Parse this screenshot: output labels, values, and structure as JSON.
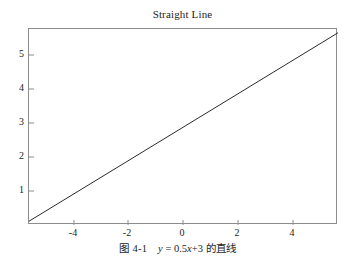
{
  "figure": {
    "title": "Straight Line",
    "caption": {
      "label": "图 4-1",
      "formula_y": "y",
      "formula_rest": "= 0.5x+3",
      "formula_x": "x",
      "formula_pre": "= 0.5",
      "formula_post": "+3",
      "suffix": "的直线",
      "full": "图 4-1  y = 0.5x+3 的直线"
    },
    "background_color": "#ffffff",
    "frame_color": "#8c8c8c",
    "line_color": "#2b2b2b",
    "text_color": "#1d1d1d"
  },
  "chart_data": {
    "type": "line",
    "title": "Straight Line",
    "xlabel": "",
    "ylabel": "",
    "equation": "y = 0.5x + 3",
    "slope": 0.5,
    "intercept": 3,
    "xlim": [
      -5,
      5
    ],
    "ylim": [
      0.4,
      5.6
    ],
    "xticks": [
      -4,
      -2,
      0,
      2,
      4
    ],
    "xtick_labels": [
      "-4",
      "-2",
      "0",
      "2",
      "4"
    ],
    "yticks": [
      1,
      2,
      3,
      4,
      5
    ],
    "ytick_labels": [
      "1",
      "2",
      "3",
      "4",
      "5"
    ],
    "grid": false,
    "legend": null,
    "series": [
      {
        "name": "y = 0.5x+3",
        "color": "#2b2b2b",
        "linewidth": 1,
        "x": [
          -5,
          -4,
          -3,
          -2,
          -1,
          0,
          1,
          2,
          3,
          4,
          5
        ],
        "values": [
          0.5,
          1.0,
          1.5,
          2.0,
          2.5,
          3.0,
          3.5,
          4.0,
          4.5,
          5.0,
          5.5
        ]
      }
    ]
  }
}
